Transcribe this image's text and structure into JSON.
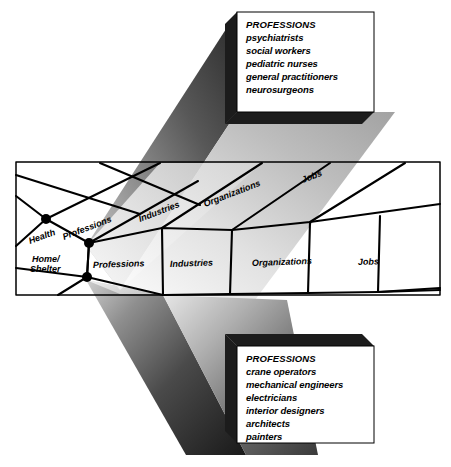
{
  "figure": {
    "background_color": "#ffffff",
    "line_color": "#000000",
    "node_color": "#000000"
  },
  "callouts": [
    {
      "id": "top",
      "heading": "PROFESSIONS",
      "items": [
        "psychiatrists",
        "social workers",
        "pediatric nurses",
        "general practitioners",
        "neurosurgeons"
      ]
    },
    {
      "id": "bottom",
      "heading": "PROFESSIONS",
      "items": [
        "crane operators",
        "mechanical engineers",
        "electricians",
        "interior designers",
        "architects",
        "painters"
      ]
    }
  ],
  "grid": {
    "row_upper": {
      "domain": "Health",
      "cells": [
        "Professions",
        "Industries",
        "Organizations",
        "Jobs"
      ]
    },
    "row_lower": {
      "domain": "Home/ Shelter",
      "cells": [
        "Professions",
        "Industries",
        "Organizations",
        "Jobs"
      ]
    }
  },
  "labels": {
    "health": "Health",
    "home_shelter_line1": "Home/",
    "home_shelter_line2": "Shelter",
    "professions_upper": "Professions",
    "industries_upper": "Industries",
    "organizations_upper": "Organizations",
    "jobs_upper": "Jobs",
    "professions_lower": "Professions",
    "industries_lower": "Industries",
    "organizations_lower": "Organizations",
    "jobs_lower": "Jobs"
  }
}
